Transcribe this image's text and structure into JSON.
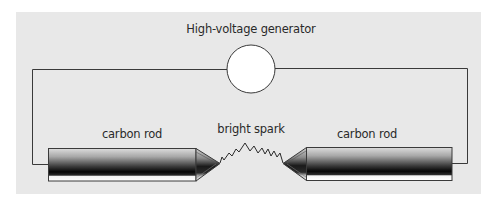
{
  "diagram": {
    "title": "High-voltage generator",
    "labels": {
      "generator": "High-voltage generator",
      "left_rod": "carbon rod",
      "right_rod": "carbon rod",
      "spark": "bright spark"
    },
    "components": [
      {
        "id": "generator",
        "type": "circle",
        "label": "High-voltage generator"
      },
      {
        "id": "left-rod",
        "type": "electrode",
        "label": "carbon rod"
      },
      {
        "id": "right-rod",
        "type": "electrode",
        "label": "carbon rod"
      },
      {
        "id": "spark",
        "type": "zigzag",
        "label": "bright spark"
      },
      {
        "id": "wire",
        "type": "circuit-wire",
        "label": ""
      }
    ],
    "colors": {
      "background": "#e8e8e8",
      "wire": "#3a3a3a",
      "generator_fill": "#ffffff",
      "rod_light": "#d8d8d8",
      "rod_dark": "#0a0a0a",
      "text": "#2a2a2a"
    }
  }
}
